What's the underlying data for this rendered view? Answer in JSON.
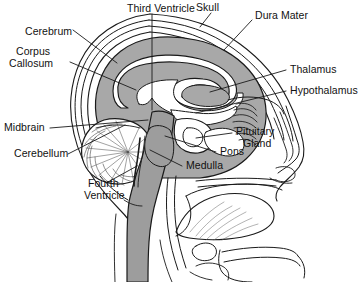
{
  "figure": {
    "background_color": "#ffffff",
    "line_color": "#1a1a1a",
    "cerebrum_fill": "#a8a8a8",
    "brainstem_fill": "#9d9d9d",
    "cavity_fill": "#ffffff"
  },
  "labels": {
    "third_ventricle": "Third Ventricle",
    "skull": "Skull",
    "dura_mater": "Dura Mater",
    "cerebrum": "Cerebrum",
    "corpus_callosum_line1": "Corpus",
    "corpus_callosum_line2": "Callosum",
    "thalamus": "Thalamus",
    "hypothalamus": "Hypothalamus",
    "midbrain": "Midbrain",
    "cerebellum": "Cerebellum",
    "fourth_ventricle_line1": "Fourth",
    "fourth_ventricle_line2": "Ventricle",
    "pons": "Pons",
    "medulla": "Medulla",
    "pituitary_gland_line1": "Pituitary",
    "pituitary_gland_line2": "Gland"
  }
}
